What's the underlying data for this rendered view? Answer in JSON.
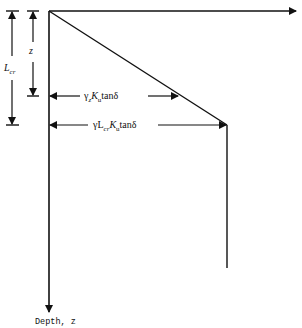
{
  "diagram": {
    "type": "earth-pressure-depth-profile",
    "axes": {
      "vertical_label": "Depth, z",
      "horizontal_label": ""
    },
    "dimensions": {
      "z": {
        "label": "z"
      },
      "critical_length": {
        "symbol": "L",
        "subscript": "cr"
      }
    },
    "annotations": {
      "stress_at_z": {
        "prefix": "γ",
        "sub1": "z",
        "k": "K",
        "k_sub": "u",
        "suffix": "tanδ"
      },
      "stress_at_lcr": {
        "prefix": "γL",
        "sub1": "cr",
        "k": "K",
        "k_sub": "u",
        "suffix": "tanδ"
      }
    },
    "colors": {
      "line": "#111111",
      "background": "#ffffff"
    }
  }
}
